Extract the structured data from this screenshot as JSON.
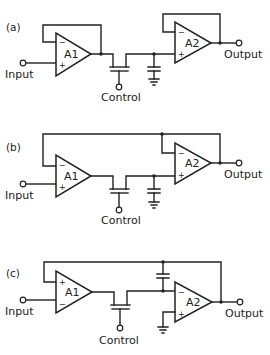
{
  "circuits": [
    {
      "tag": "(a)",
      "amp1": {
        "label": "A1",
        "top_input": "−",
        "bottom_input": "+"
      },
      "amp2": {
        "label": "A2",
        "top_input": "−",
        "bottom_input": "+"
      },
      "input_label": "Input",
      "output_label": "Output",
      "control_label": "Control",
      "topology": "A1 unity-gain buffer, FET switch, hold capacitor to ground, A2 unity-gain buffer"
    },
    {
      "tag": "(b)",
      "amp1": {
        "label": "A1",
        "top_input": "−",
        "bottom_input": "+"
      },
      "amp2": {
        "label": "A2",
        "top_input": "−",
        "bottom_input": "+"
      },
      "input_label": "Input",
      "output_label": "Output",
      "control_label": "Control",
      "topology": "Overall feedback from A2 output to A1 inverting input, hold capacitor to ground"
    },
    {
      "tag": "(c)",
      "amp1": {
        "label": "A1",
        "top_input": "+",
        "bottom_input": "−"
      },
      "amp2": {
        "label": "A2",
        "top_input": "−",
        "bottom_input": "+"
      },
      "input_label": "Input",
      "output_label": "Output",
      "control_label": "Control",
      "topology": "A2 integrator with hold capacitor in feedback, overall feedback to A1 non-inverting input"
    }
  ]
}
